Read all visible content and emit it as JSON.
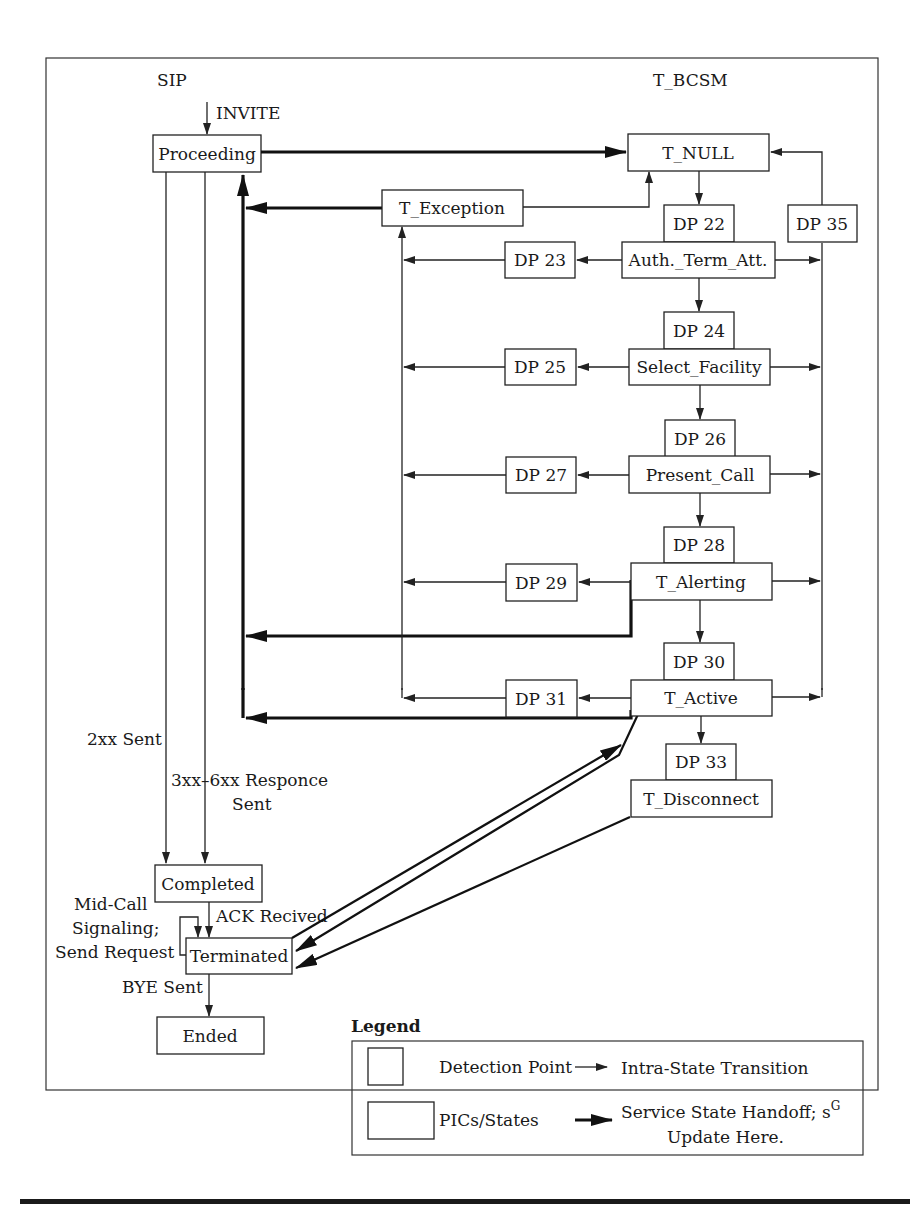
{
  "diagram": {
    "title_left": "SIP",
    "title_right": "T_BCSM",
    "sip_states": {
      "proceeding": "Proceeding",
      "completed": "Completed",
      "terminated": "Terminated",
      "ended": "Ended"
    },
    "sip_labels": {
      "invite": "INVITE",
      "sent_2xx": "2xx Sent",
      "resp_3xx_6xx_line1": "3xx–6xx Responce",
      "resp_3xx_6xx_line2": "Sent",
      "ack": "ACK Recived",
      "midcall_line1": "Mid-Call",
      "midcall_line2": "Signaling;",
      "midcall_line3": "Send Request",
      "bye": "BYE Sent"
    },
    "bcsm_states": {
      "t_null": "T_NULL",
      "t_exception": "T_Exception",
      "auth_term_att": "Auth._Term_Att.",
      "select_facility": "Select_Facility",
      "present_call": "Present_Call",
      "t_alerting": "T_Alerting",
      "t_active": "T_Active",
      "t_disconnect": "T_Disconnect"
    },
    "detection_points": {
      "dp22": "DP 22",
      "dp23": "DP 23",
      "dp24": "DP 24",
      "dp25": "DP 25",
      "dp26": "DP 26",
      "dp27": "DP 27",
      "dp28": "DP 28",
      "dp29": "DP 29",
      "dp30": "DP 30",
      "dp31": "DP 31",
      "dp33": "DP 33",
      "dp35": "DP 35"
    },
    "legend": {
      "title": "Legend",
      "detection_point": "Detection Point",
      "pics_states": "PICs/States",
      "intra_state": "Intra-State Transition",
      "handoff_line1": "Service State Handoff; s",
      "handoff_sup": "G",
      "handoff_line2": "Update Here."
    }
  }
}
